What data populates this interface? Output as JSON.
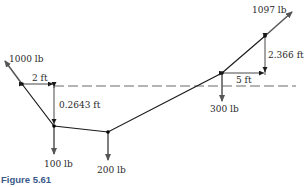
{
  "figure": {
    "caption": "Figure 5.61",
    "colors": {
      "line": "#1a1a1a",
      "arrow": "#555555",
      "caption": "#3a5a8a",
      "dashed": "#444444"
    },
    "forces": {
      "left_tension": "1000 lb",
      "right_tension": "1097 lb",
      "load_1": "100 lb",
      "load_2": "200 lb",
      "load_3": "300 lb"
    },
    "dimensions": {
      "left_horizontal": "2 ft",
      "left_vertical": "0.2643 ft",
      "right_horizontal": "5 ft",
      "right_vertical": "2.366 ft"
    }
  }
}
